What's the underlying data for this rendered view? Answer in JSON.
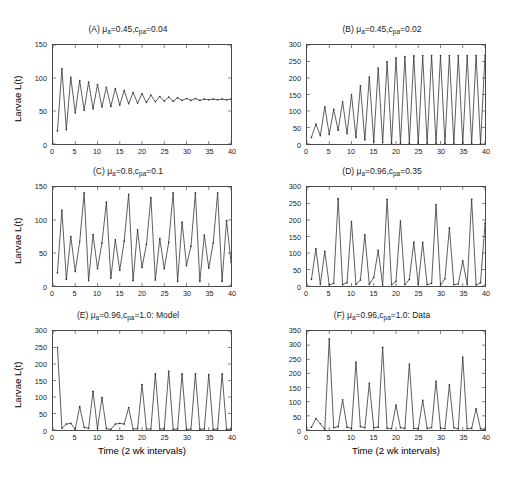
{
  "figure": {
    "xlabel": "Time (2 wk intervals)",
    "ylabel": "Larvae L(t)",
    "xticks": [
      0,
      5,
      10,
      15,
      20,
      25,
      30,
      35,
      40
    ],
    "line_color": "#333333"
  },
  "chart_data": [
    {
      "type": "line",
      "panel": "A",
      "title_prefix": "(A) ",
      "title_mu": "=0.45,",
      "title_c": "=0.04",
      "title_plain": "(A) μa=0.45,cpa=0.04",
      "mu_a": 0.45,
      "c_pa": 0.04,
      "xlabel": "Time (2 wk intervals)",
      "ylabel": "Larvae L(t)",
      "xlim": [
        0,
        40
      ],
      "ylim": [
        0,
        150
      ],
      "yticks": [
        0,
        50,
        100,
        150
      ],
      "xticks": [
        0,
        5,
        10,
        15,
        20,
        25,
        30,
        35,
        40
      ],
      "grid": false,
      "legend": "none",
      "x": [
        1,
        2,
        3,
        4,
        5,
        6,
        7,
        8,
        9,
        10,
        11,
        12,
        13,
        14,
        15,
        16,
        17,
        18,
        19,
        20,
        21,
        22,
        23,
        24,
        25,
        26,
        27,
        28,
        29,
        30,
        31,
        32,
        33,
        34,
        35,
        36,
        37,
        38,
        39,
        40
      ],
      "values": [
        20,
        114,
        22,
        101,
        47,
        96,
        51,
        94,
        53,
        90,
        56,
        86,
        57,
        84,
        59,
        81,
        61,
        78,
        62,
        76,
        63,
        74,
        64,
        72,
        65,
        71,
        65,
        70,
        66,
        69,
        66,
        69,
        66,
        68,
        67,
        68,
        67,
        68,
        67,
        68
      ]
    },
    {
      "type": "line",
      "panel": "B",
      "title_prefix": "(B) ",
      "title_mu": "=0.45,",
      "title_c": "=0.02",
      "title_plain": "(B) μa=0.45,cpa=0.02",
      "mu_a": 0.45,
      "c_pa": 0.02,
      "xlabel": "Time (2 wk intervals)",
      "ylabel": "Larvae L(t)",
      "xlim": [
        0,
        40
      ],
      "ylim": [
        0,
        300
      ],
      "yticks": [
        0,
        50,
        100,
        150,
        200,
        250,
        300
      ],
      "xticks": [
        0,
        5,
        10,
        15,
        20,
        25,
        30,
        35,
        40
      ],
      "grid": false,
      "legend": "none",
      "x": [
        1,
        2,
        3,
        4,
        5,
        6,
        7,
        8,
        9,
        10,
        11,
        12,
        13,
        14,
        15,
        16,
        17,
        18,
        19,
        20,
        21,
        22,
        23,
        24,
        25,
        26,
        27,
        28,
        29,
        30,
        31,
        32,
        33,
        34,
        35,
        36,
        37,
        38,
        39,
        40
      ],
      "values": [
        20,
        60,
        25,
        113,
        29,
        105,
        42,
        128,
        31,
        150,
        20,
        176,
        12,
        203,
        7,
        230,
        4,
        249,
        2,
        261,
        1,
        265,
        1,
        267,
        1,
        268,
        1,
        268,
        1,
        268,
        1,
        268,
        1,
        268,
        1,
        268,
        1,
        268,
        1,
        268
      ]
    },
    {
      "type": "line",
      "panel": "C",
      "title_prefix": "(C) ",
      "title_mu": "=0.8,",
      "title_c": "=0.1",
      "title_plain": "(C) μa=0.8,cpa=0.1",
      "mu_a": 0.8,
      "c_pa": 0.1,
      "xlabel": "Time (2 wk intervals)",
      "ylabel": "Larvae L(t)",
      "xlim": [
        0,
        40
      ],
      "ylim": [
        0,
        150
      ],
      "yticks": [
        0,
        50,
        100,
        150
      ],
      "xticks": [
        0,
        5,
        10,
        15,
        20,
        25,
        30,
        35,
        40
      ],
      "grid": false,
      "legend": "none",
      "x": [
        1,
        2,
        3,
        4,
        5,
        6,
        7,
        8,
        9,
        10,
        11,
        12,
        13,
        14,
        15,
        16,
        17,
        18,
        19,
        20,
        21,
        22,
        23,
        24,
        25,
        26,
        27,
        28,
        29,
        30,
        31,
        32,
        33,
        34,
        35,
        36,
        37,
        38,
        39,
        40
      ],
      "values": [
        20,
        115,
        10,
        75,
        22,
        67,
        141,
        8,
        78,
        26,
        65,
        127,
        12,
        70,
        24,
        68,
        139,
        8,
        85,
        28,
        63,
        134,
        9,
        72,
        26,
        66,
        141,
        7,
        97,
        31,
        60,
        141,
        7,
        77,
        27,
        65,
        141,
        7,
        99,
        36
      ]
    },
    {
      "type": "line",
      "panel": "D",
      "title_prefix": "(D) ",
      "title_mu": "=0.96,",
      "title_c": "=0.35",
      "title_plain": "(D) μa=0.96,cpa=0.35",
      "mu_a": 0.96,
      "c_pa": 0.35,
      "xlabel": "Time (2 wk intervals)",
      "ylabel": "Larvae L(t)",
      "xlim": [
        0,
        40
      ],
      "ylim": [
        0,
        300
      ],
      "yticks": [
        0,
        50,
        100,
        150,
        200,
        250,
        300
      ],
      "xticks": [
        0,
        5,
        10,
        15,
        20,
        25,
        30,
        35,
        40
      ],
      "grid": false,
      "legend": "none",
      "x": [
        1,
        2,
        3,
        4,
        5,
        6,
        7,
        8,
        9,
        10,
        11,
        12,
        13,
        14,
        15,
        16,
        17,
        18,
        19,
        20,
        21,
        22,
        23,
        24,
        25,
        26,
        27,
        28,
        29,
        30,
        31,
        32,
        33,
        34,
        35,
        36,
        37,
        38,
        39,
        40
      ],
      "values": [
        20,
        113,
        5,
        105,
        3,
        8,
        265,
        4,
        10,
        195,
        5,
        18,
        155,
        5,
        26,
        108,
        3,
        263,
        4,
        14,
        197,
        4,
        20,
        133,
        5,
        132,
        4,
        8,
        247,
        3,
        22,
        176,
        4,
        6,
        76,
        4,
        263,
        3,
        10,
        190
      ]
    },
    {
      "type": "line",
      "panel": "E",
      "title_prefix": "(E) ",
      "title_mu": "=0.96,",
      "title_c": "=1.0: Model",
      "title_plain": "(E) μa=0.96,cpa=1.0: Model",
      "mu_a": 0.96,
      "c_pa": 1.0,
      "xlabel": "Time (2 wk intervals)",
      "ylabel": "Larvae L(t)",
      "xlim": [
        0,
        40
      ],
      "ylim": [
        0,
        300
      ],
      "yticks": [
        0,
        50,
        100,
        150,
        200,
        250,
        300
      ],
      "xticks": [
        0,
        5,
        10,
        15,
        20,
        25,
        30,
        35,
        40
      ],
      "grid": false,
      "legend": "none",
      "x": [
        1,
        2,
        3,
        4,
        5,
        6,
        7,
        8,
        9,
        10,
        11,
        12,
        13,
        14,
        15,
        16,
        17,
        18,
        19,
        20,
        21,
        22,
        23,
        24,
        25,
        26,
        27,
        28,
        29,
        30,
        31,
        32,
        33,
        34,
        35,
        36,
        37,
        38,
        39,
        40
      ],
      "values": [
        250,
        5,
        18,
        20,
        2,
        71,
        8,
        5,
        117,
        4,
        98,
        4,
        2,
        18,
        20,
        18,
        68,
        3,
        4,
        138,
        3,
        3,
        170,
        3,
        3,
        178,
        2,
        3,
        170,
        2,
        3,
        170,
        2,
        3,
        168,
        2,
        3,
        170,
        2,
        3
      ]
    },
    {
      "type": "line",
      "panel": "F",
      "title_prefix": "(F) ",
      "title_mu": "=0.96,",
      "title_c": "=1.0: Data",
      "title_plain": "(F) μa=0.96,cpa=1.0: Data",
      "mu_a": 0.96,
      "c_pa": 1.0,
      "xlabel": "Time (2 wk intervals)",
      "ylabel": "Larvae L(t)",
      "xlim": [
        0,
        40
      ],
      "ylim": [
        0,
        350
      ],
      "yticks": [
        0,
        50,
        100,
        150,
        200,
        250,
        300,
        350
      ],
      "xticks": [
        0,
        5,
        10,
        15,
        20,
        25,
        30,
        35,
        40
      ],
      "grid": false,
      "legend": "none",
      "x": [
        1,
        2,
        3,
        4,
        5,
        6,
        7,
        8,
        9,
        10,
        11,
        12,
        13,
        14,
        15,
        16,
        17,
        18,
        19,
        20,
        21,
        22,
        23,
        24,
        25,
        26,
        27,
        28,
        29,
        30,
        31,
        32,
        33,
        34,
        35,
        36,
        37,
        38,
        39,
        40
      ],
      "values": [
        10,
        40,
        22,
        3,
        322,
        8,
        12,
        107,
        10,
        5,
        240,
        12,
        8,
        165,
        8,
        10,
        292,
        6,
        5,
        88,
        8,
        6,
        233,
        6,
        4,
        105,
        6,
        8,
        172,
        7,
        5,
        160,
        8,
        4,
        258,
        5,
        6,
        75,
        4,
        2
      ]
    }
  ]
}
